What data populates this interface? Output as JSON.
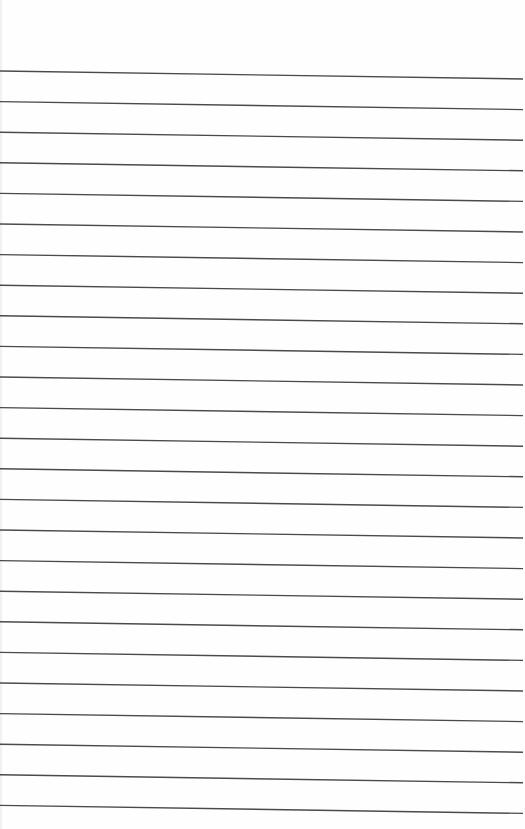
{
  "page": {
    "type": "lined-paper",
    "background": "#fefefe",
    "line_color": "#4a4a4a",
    "line_count": 25,
    "first_line_y_left": 71,
    "first_line_y_right": 79,
    "line_spacing": 30.6,
    "line_width": 1.4
  }
}
